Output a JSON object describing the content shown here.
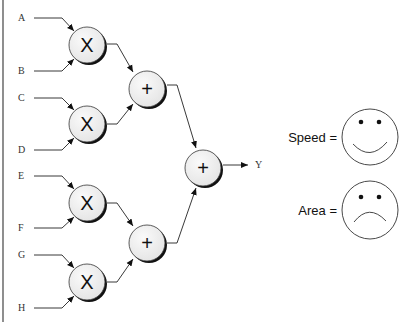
{
  "diagram": {
    "inputs": [
      {
        "id": "A",
        "label": "A",
        "y": 18
      },
      {
        "id": "B",
        "label": "B",
        "y": 71
      },
      {
        "id": "C",
        "label": "C",
        "y": 98
      },
      {
        "id": "D",
        "label": "D",
        "y": 150
      },
      {
        "id": "E",
        "label": "E",
        "y": 176
      },
      {
        "id": "F",
        "label": "F",
        "y": 228
      },
      {
        "id": "G",
        "label": "G",
        "y": 255
      },
      {
        "id": "H",
        "label": "H",
        "y": 308
      }
    ],
    "nodes": [
      {
        "id": "mul1",
        "op": "X",
        "inputs": [
          "A",
          "B"
        ]
      },
      {
        "id": "mul2",
        "op": "X",
        "inputs": [
          "C",
          "D"
        ]
      },
      {
        "id": "mul3",
        "op": "X",
        "inputs": [
          "E",
          "F"
        ]
      },
      {
        "id": "mul4",
        "op": "X",
        "inputs": [
          "G",
          "H"
        ]
      },
      {
        "id": "add1",
        "op": "+",
        "inputs": [
          "mul1",
          "mul2"
        ]
      },
      {
        "id": "add2",
        "op": "+",
        "inputs": [
          "mul3",
          "mul4"
        ]
      },
      {
        "id": "add3",
        "op": "+",
        "inputs": [
          "add1",
          "add2"
        ]
      }
    ],
    "output": {
      "label": "Y"
    },
    "metrics": [
      {
        "label": "Speed =",
        "face": "happy"
      },
      {
        "label": "Area =",
        "face": "sad"
      }
    ]
  }
}
